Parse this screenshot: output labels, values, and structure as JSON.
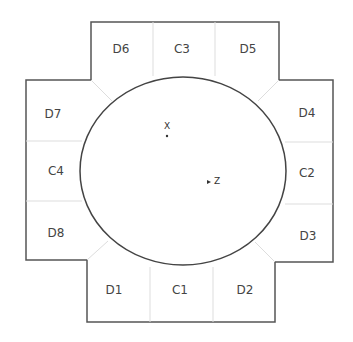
{
  "diagram": {
    "colors": {
      "outline": "#555555",
      "divider": "#dddddd",
      "circle": "#444444",
      "text": "#444444"
    },
    "regions": [
      {
        "id": "D6",
        "label": "D6",
        "x": 121,
        "y": 49
      },
      {
        "id": "C3",
        "label": "C3",
        "x": 182,
        "y": 49
      },
      {
        "id": "D5",
        "label": "D5",
        "x": 248,
        "y": 49
      },
      {
        "id": "D7",
        "label": "D7",
        "x": 53,
        "y": 114
      },
      {
        "id": "D4",
        "label": "D4",
        "x": 307,
        "y": 113
      },
      {
        "id": "C4",
        "label": "C4",
        "x": 56,
        "y": 171
      },
      {
        "id": "C2",
        "label": "C2",
        "x": 307,
        "y": 173
      },
      {
        "id": "D8",
        "label": "D8",
        "x": 56,
        "y": 233
      },
      {
        "id": "D3",
        "label": "D3",
        "x": 308,
        "y": 236
      },
      {
        "id": "D1",
        "label": "D1",
        "x": 114,
        "y": 290
      },
      {
        "id": "C1",
        "label": "C1",
        "x": 180,
        "y": 290
      },
      {
        "id": "D2",
        "label": "D2",
        "x": 245,
        "y": 290
      }
    ],
    "points": [
      {
        "id": "X",
        "label": "X"
      },
      {
        "id": "Z",
        "label": "Z"
      }
    ]
  }
}
